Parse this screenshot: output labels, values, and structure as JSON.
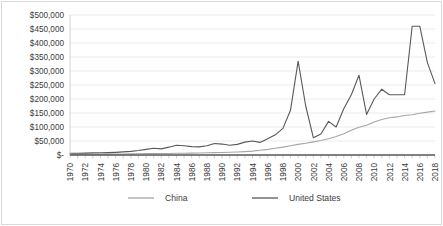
{
  "chart_data": {
    "type": "line",
    "title": "",
    "subtitle": "",
    "xlabel": "",
    "ylabel": "",
    "ylim": [
      0,
      500000
    ],
    "ytick_labels": [
      "$500,000",
      "$450,000",
      "$400,000",
      "$350,000",
      "$300,000",
      "$250,000",
      "$200,000",
      "$150,000",
      "$100,000",
      "$50,000",
      "$-"
    ],
    "ytick_values": [
      500000,
      450000,
      400000,
      350000,
      300000,
      250000,
      200000,
      150000,
      100000,
      50000,
      0
    ],
    "grid": true,
    "legend_position": "bottom",
    "x": [
      1970,
      1971,
      1972,
      1973,
      1974,
      1975,
      1976,
      1977,
      1978,
      1979,
      1980,
      1981,
      1982,
      1983,
      1984,
      1985,
      1986,
      1987,
      1988,
      1989,
      1990,
      1991,
      1992,
      1993,
      1994,
      1995,
      1996,
      1997,
      1998,
      1999,
      2000,
      2001,
      2002,
      2003,
      2004,
      2005,
      2006,
      2007,
      2008,
      2009,
      2010,
      2011,
      2012,
      2013,
      2014,
      2015,
      2016,
      2017,
      2018
    ],
    "xtick_labels": [
      "1970",
      "1972",
      "1974",
      "1976",
      "1978",
      "1980",
      "1982",
      "1984",
      "1986",
      "1988",
      "1990",
      "1992",
      "1994",
      "1996",
      "1998",
      "2000",
      "2002",
      "2004",
      "2006",
      "2008",
      "2010",
      "2012",
      "2014",
      "2016",
      "2018"
    ],
    "series": [
      {
        "name": "China",
        "color": "#a6a6a6",
        "values": [
          2000,
          2200,
          2400,
          2700,
          3000,
          3200,
          3400,
          3700,
          4000,
          4400,
          4800,
          5000,
          5200,
          5600,
          6000,
          6400,
          6800,
          7400,
          8000,
          8400,
          8800,
          9600,
          10500,
          12000,
          14000,
          17000,
          20000,
          24000,
          28000,
          33000,
          38000,
          42000,
          47000,
          52000,
          58000,
          66000,
          76000,
          88000,
          99000,
          106000,
          118000,
          127000,
          133000,
          136000,
          141000,
          144000,
          149000,
          153000,
          157000
        ]
      },
      {
        "name": "United States",
        "color": "#595959",
        "values": [
          6000,
          6200,
          6800,
          7500,
          8000,
          8500,
          9500,
          11000,
          13000,
          16000,
          20000,
          24000,
          22000,
          28000,
          35000,
          33000,
          30000,
          29000,
          33000,
          41000,
          39000,
          35000,
          38000,
          46000,
          50000,
          45000,
          58000,
          72000,
          95000,
          160000,
          335000,
          175000,
          62000,
          75000,
          120000,
          100000,
          165000,
          215000,
          285000,
          145000,
          200000,
          235000,
          215000,
          215000,
          215000,
          460000,
          460000,
          330000,
          255000
        ]
      }
    ]
  },
  "legend": {
    "items": [
      {
        "label": "China",
        "color": "#a6a6a6"
      },
      {
        "label": "United States",
        "color": "#595959"
      }
    ]
  }
}
